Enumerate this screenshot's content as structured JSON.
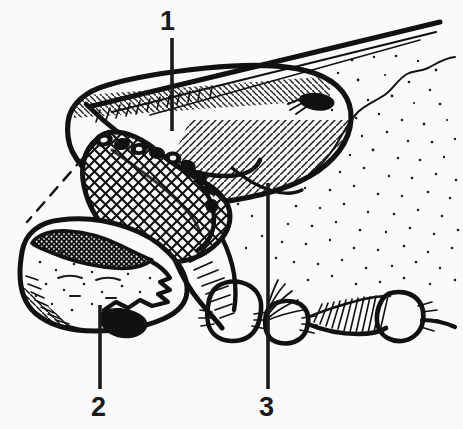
{
  "figure": {
    "kind": "black-and-white surgical / dental line drawing",
    "background_color": "#fafafa",
    "ink_color": "#111111",
    "width": 463,
    "height": 429
  },
  "callouts": [
    {
      "id": "1",
      "label": "1",
      "label_x": 160,
      "label_y": 8,
      "leader_x": 172,
      "leader_top": 38,
      "leader_bottom": 131
    },
    {
      "id": "2",
      "label": "2",
      "label_x": 91,
      "label_y": 394,
      "leader_x": 100,
      "leader_top": 305,
      "leader_bottom": 389
    },
    {
      "id": "3",
      "label": "3",
      "label_x": 259,
      "label_y": 394,
      "leader_x": 268,
      "leader_top": 183,
      "leader_bottom": 389
    }
  ],
  "regions": [
    {
      "name": "upper-body-outline",
      "description": "large curved lobe occupying upper-centre and upper-right, outlined with heavy ink and filled with diagonal hatching along its lower-right flank"
    },
    {
      "name": "probe-shaft",
      "description": "thick straight instrument shaft running from upper-right corner down toward the centre-left of the lobe"
    },
    {
      "name": "cross-hatched-mass",
      "description": "diamond cross-hatched mass in the centre-left of the drawing, bounded by a heavy irregular outline"
    },
    {
      "name": "detail-inset",
      "description": "lower-left enlarged detail, outlined in heavy ink, stippled interior with a dark mottled band along its upper edge and diagonal hatching at the lower-left"
    },
    {
      "name": "magnification-leaders",
      "description": "two dashed leader lines linking the cross-hatched mass to the lower-left enlarged detail inset"
    },
    {
      "name": "tooth-row",
      "description": "row of four tooth-like shapes along the bottom-centre and bottom-right, drawn with short hatch strokes"
    },
    {
      "name": "stipple-field",
      "description": "field of fine stipple dots filling the right half of the drawing, representing cancellous bone texture"
    },
    {
      "name": "contour-line",
      "description": "thin wavy contour line running from the right edge down toward the centre of the drawing"
    }
  ]
}
